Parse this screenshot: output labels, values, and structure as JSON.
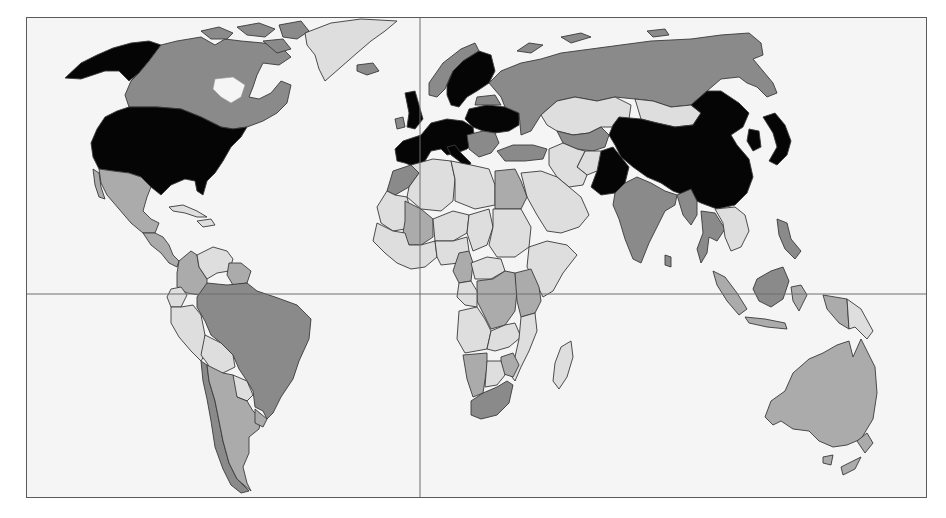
{
  "map": {
    "type": "choropleth",
    "projection": "world, Pacific-split, equator and prime-meridian lines",
    "background": "#f5f5f5",
    "frame_color": "#5a5a5a",
    "grid_lines": {
      "equator_y": 293,
      "prime_meridian_x": 419
    },
    "classes": [
      {
        "id": "c4",
        "name": "highest",
        "color": "#050505"
      },
      {
        "id": "c3",
        "name": "high",
        "color": "#8a8a8a"
      },
      {
        "id": "c2",
        "name": "medium",
        "color": "#ababab"
      },
      {
        "id": "c1",
        "name": "low",
        "color": "#dedede"
      }
    ],
    "regions": [
      {
        "name": "Alaska (United States)",
        "class": "c4"
      },
      {
        "name": "United States",
        "class": "c4"
      },
      {
        "name": "Canada",
        "class": "c3"
      },
      {
        "name": "Greenland",
        "class": "c1"
      },
      {
        "name": "Mexico",
        "class": "c2"
      },
      {
        "name": "Central America",
        "class": "c2"
      },
      {
        "name": "Cuba / Caribbean",
        "class": "c1"
      },
      {
        "name": "Colombia",
        "class": "c2"
      },
      {
        "name": "Venezuela",
        "class": "c1"
      },
      {
        "name": "Guyana / Suriname",
        "class": "c2"
      },
      {
        "name": "Ecuador",
        "class": "c1"
      },
      {
        "name": "Peru",
        "class": "c1"
      },
      {
        "name": "Brazil",
        "class": "c3"
      },
      {
        "name": "Bolivia",
        "class": "c1"
      },
      {
        "name": "Paraguay",
        "class": "c1"
      },
      {
        "name": "Chile",
        "class": "c3"
      },
      {
        "name": "Argentina",
        "class": "c2"
      },
      {
        "name": "Uruguay",
        "class": "c2"
      },
      {
        "name": "Western Europe",
        "class": "c4"
      },
      {
        "name": "United Kingdom",
        "class": "c4"
      },
      {
        "name": "Ireland",
        "class": "c3"
      },
      {
        "name": "Iceland",
        "class": "c3"
      },
      {
        "name": "Norway",
        "class": "c3"
      },
      {
        "name": "Sweden / Finland",
        "class": "c4"
      },
      {
        "name": "Poland / Ukraine",
        "class": "c4"
      },
      {
        "name": "Balkans",
        "class": "c3"
      },
      {
        "name": "Russia",
        "class": "c3"
      },
      {
        "name": "Turkey",
        "class": "c3"
      },
      {
        "name": "Kazakhstan",
        "class": "c1"
      },
      {
        "name": "Central Asia",
        "class": "c3"
      },
      {
        "name": "Mongolia",
        "class": "c1"
      },
      {
        "name": "China",
        "class": "c4"
      },
      {
        "name": "Pakistan",
        "class": "c4"
      },
      {
        "name": "Afghanistan",
        "class": "c1"
      },
      {
        "name": "Iran",
        "class": "c1"
      },
      {
        "name": "Saudi Arabia / Arabia",
        "class": "c1"
      },
      {
        "name": "India",
        "class": "c3"
      },
      {
        "name": "Japan",
        "class": "c4"
      },
      {
        "name": "Korea",
        "class": "c4"
      },
      {
        "name": "Myanmar",
        "class": "c3"
      },
      {
        "name": "Thailand",
        "class": "c3"
      },
      {
        "name": "Vietnam / Laos",
        "class": "c1"
      },
      {
        "name": "Philippines",
        "class": "c3"
      },
      {
        "name": "Indonesia",
        "class": "c2"
      },
      {
        "name": "Malaysia (Borneo)",
        "class": "c3"
      },
      {
        "name": "Papua New Guinea",
        "class": "c1"
      },
      {
        "name": "Australia",
        "class": "c2"
      },
      {
        "name": "New Zealand",
        "class": "c2"
      },
      {
        "name": "Morocco",
        "class": "c3"
      },
      {
        "name": "Algeria",
        "class": "c1"
      },
      {
        "name": "Libya",
        "class": "c1"
      },
      {
        "name": "Egypt",
        "class": "c2"
      },
      {
        "name": "Mali",
        "class": "c2"
      },
      {
        "name": "Niger / Chad / Sudan",
        "class": "c1"
      },
      {
        "name": "Cameroon",
        "class": "c2"
      },
      {
        "name": "Ethiopia / Horn of Africa",
        "class": "c1"
      },
      {
        "name": "Central Africa",
        "class": "c1"
      },
      {
        "name": "DR Congo",
        "class": "c2"
      },
      {
        "name": "Tanzania",
        "class": "c2"
      },
      {
        "name": "Angola / Zambia",
        "class": "c1"
      },
      {
        "name": "Namibia",
        "class": "c2"
      },
      {
        "name": "Botswana",
        "class": "c1"
      },
      {
        "name": "Zimbabwe",
        "class": "c2"
      },
      {
        "name": "Mozambique",
        "class": "c1"
      },
      {
        "name": "South Africa",
        "class": "c3"
      },
      {
        "name": "Madagascar",
        "class": "c1"
      }
    ]
  }
}
